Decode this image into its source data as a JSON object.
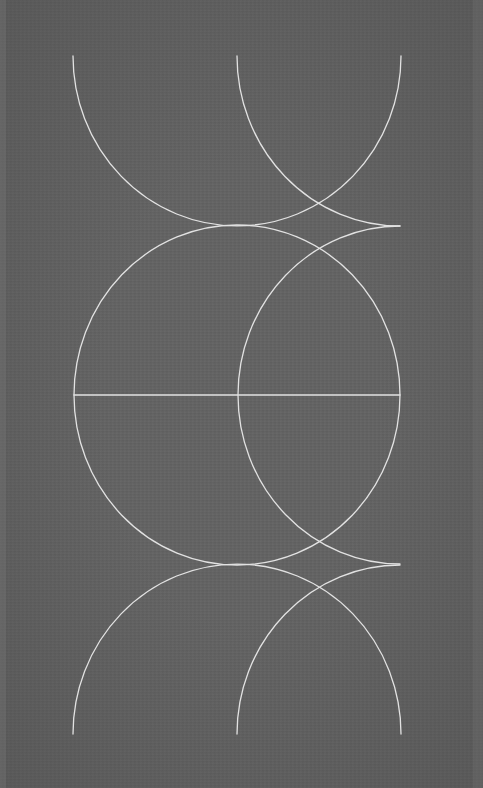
{
  "artwork": {
    "type": "geometric-line-drawing",
    "background_color": "#636363",
    "line_color": "#e2e2e2",
    "canvas": {
      "width": 483,
      "height": 788
    },
    "shapes": {
      "top_left_semicircle": {
        "cx": 237,
        "cy": 56,
        "r": 164,
        "part": "lower-half"
      },
      "top_right_quarter": {
        "cx": 400,
        "cy": 56,
        "r": 163,
        "part": "lower-left-quarter"
      },
      "middle_full_circle": {
        "cx": 237,
        "cy": 395,
        "rx": 163,
        "ry": 169
      },
      "middle_right_half": {
        "cx": 400,
        "cy": 395,
        "rx": 162,
        "ry": 169,
        "part": "left-half"
      },
      "middle_diameter": {
        "x1": 74,
        "y1": 395,
        "x2": 400,
        "y2": 395
      },
      "bottom_left_semicircle": {
        "cx": 237,
        "cy": 734,
        "r": 164,
        "part": "upper-half"
      },
      "bottom_right_quarter": {
        "cx": 400,
        "cy": 734,
        "r": 163,
        "part": "upper-left-quarter"
      }
    }
  }
}
